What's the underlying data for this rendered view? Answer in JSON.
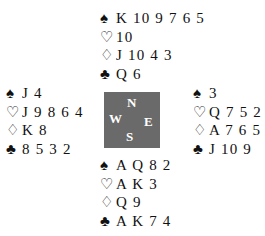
{
  "hands": {
    "north": {
      "spades": "K 10 9 7 6 5",
      "hearts": "10",
      "diamonds": "J 10 4 3",
      "clubs": "Q 6"
    },
    "west": {
      "spades": "J 4",
      "hearts": "J 9 8 6 4",
      "diamonds": "K 8",
      "clubs": "8 5 3 2"
    },
    "east": {
      "spades": "3",
      "hearts": "Q 7 5 2",
      "diamonds": "A 7 6 5 2",
      "clubs": "J 10 9"
    },
    "south": {
      "spades": "A Q 8 2",
      "hearts": "A K 3",
      "diamonds": "Q 9",
      "clubs": "A K 7 4"
    }
  },
  "suits": {
    "spades": "♠",
    "hearts": "♡",
    "diamonds": "♢",
    "clubs": "♣"
  },
  "compass": {
    "north": "N",
    "south": "S",
    "east": "E",
    "west": "W",
    "color": "#6a6a6a"
  }
}
